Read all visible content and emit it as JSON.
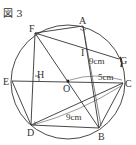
{
  "figure": {
    "title": "図 3",
    "circle": {
      "cx": 68,
      "cy": 82,
      "r": 57
    },
    "center": {
      "label": "O",
      "x": 68,
      "y": 81
    },
    "points": [
      {
        "label": "A",
        "x": 83,
        "y": 26
      },
      {
        "label": "F",
        "x": 35,
        "y": 33
      },
      {
        "label": "G",
        "x": 119,
        "y": 59
      },
      {
        "label": "E",
        "x": 12,
        "y": 81
      },
      {
        "label": "C",
        "x": 123,
        "y": 83
      },
      {
        "label": "D",
        "x": 31,
        "y": 125
      },
      {
        "label": "B",
        "x": 99,
        "y": 128
      },
      {
        "label": "H",
        "x": 35,
        "y": 81
      },
      {
        "label": "I",
        "x": 84,
        "y": 52
      }
    ],
    "measurements": [
      {
        "label": "9cm",
        "segment": "AB"
      },
      {
        "label": "5cm",
        "segment": "OC"
      },
      {
        "label": "9cm",
        "segment": "DC"
      }
    ],
    "colors": {
      "stroke": "#333333",
      "background": "#ffffff"
    }
  }
}
